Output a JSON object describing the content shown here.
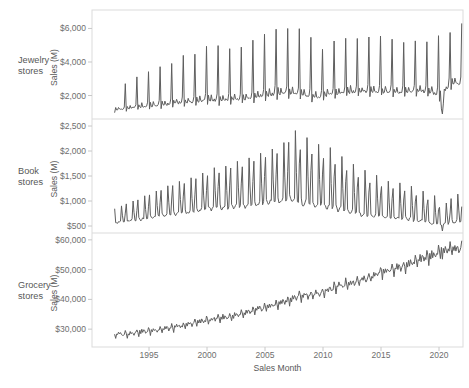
{
  "figure": {
    "background": "#ffffff"
  },
  "chart_data": {
    "type": "line",
    "title": "",
    "xlabel": "Sales Month",
    "legend": "none",
    "grid": "off",
    "line_color": "#5e5e5e",
    "border_color": "#dbdbdb",
    "tick_color": "#c8c8c8",
    "text_color": "#6e6e6e",
    "x_range": [
      1992,
      2022
    ],
    "x_ticks": {
      "values": [
        1995,
        2000,
        2005,
        2010,
        2015,
        2020
      ],
      "labels": [
        "1995",
        "2000",
        "2005",
        "2010",
        "2015",
        "2020"
      ]
    },
    "start_year": 1992,
    "end_year": 2021,
    "panels": [
      {
        "label": "Jewelry stores",
        "label_lines": [
          "Jewelry",
          "stores"
        ],
        "ylabel": "Sales (M)",
        "y_ticks": {
          "values": [
            2000,
            4000,
            6000
          ],
          "labels": [
            "$2,000",
            "$4,000",
            "$6,000"
          ]
        },
        "y_range": [
          600,
          7100
        ],
        "model": {
          "kind": "spike",
          "years": [
            1992,
            1993,
            1994,
            1995,
            1996,
            1997,
            1998,
            1999,
            2000,
            2001,
            2002,
            2003,
            2004,
            2005,
            2006,
            2007,
            2008,
            2009,
            2010,
            2011,
            2012,
            2013,
            2014,
            2015,
            2016,
            2017,
            2018,
            2019,
            2020,
            2021
          ],
          "base": [
            1100,
            1150,
            1250,
            1300,
            1350,
            1450,
            1500,
            1550,
            1650,
            1600,
            1650,
            1700,
            1800,
            1900,
            2000,
            2050,
            1950,
            1800,
            1900,
            2000,
            2100,
            2150,
            2150,
            2150,
            2100,
            2100,
            2150,
            2150,
            1900,
            2600
          ],
          "peak": [
            2700,
            3100,
            3450,
            3750,
            3900,
            4400,
            4450,
            4900,
            4950,
            4750,
            4900,
            5250,
            5600,
            5900,
            6000,
            5950,
            5450,
            4750,
            5250,
            5400,
            5450,
            5500,
            5550,
            5350,
            5200,
            5300,
            5250,
            5550,
            5800,
            6300
          ],
          "seasonal_shape": [
            -0.05,
            0.1,
            0.02,
            0.02,
            0.12,
            0.04,
            0.02,
            0.04,
            0.02,
            0.04,
            0.14,
            1.0
          ],
          "jitter": 0.035,
          "overrides": {
            "2020-3": 1200,
            "2020-4": 900,
            "2020-5": 1500
          }
        }
      },
      {
        "label": "Book stores",
        "label_lines": [
          "Book",
          "stores"
        ],
        "ylabel": "Sales (M)",
        "y_ticks": {
          "values": [
            500,
            1000,
            1500,
            2000,
            2500
          ],
          "labels": [
            "$500",
            "$1,000",
            "$1,500",
            "$2,000",
            "$2,500"
          ]
        },
        "y_range": [
          360,
          2640
        ],
        "model": {
          "kind": "spike",
          "years": [
            1992,
            1993,
            1994,
            1995,
            1996,
            1997,
            1998,
            1999,
            2000,
            2001,
            2002,
            2003,
            2004,
            2005,
            2006,
            2007,
            2008,
            2009,
            2010,
            2011,
            2012,
            2013,
            2014,
            2015,
            2016,
            2017,
            2018,
            2019,
            2020,
            2021
          ],
          "base": [
            550,
            570,
            600,
            640,
            680,
            700,
            720,
            750,
            800,
            820,
            830,
            850,
            870,
            900,
            920,
            950,
            900,
            850,
            820,
            780,
            740,
            700,
            660,
            640,
            620,
            600,
            570,
            550,
            480,
            550
          ],
          "peak": [
            900,
            1000,
            1100,
            1200,
            1300,
            1400,
            1450,
            1550,
            1650,
            1700,
            1800,
            1850,
            1950,
            2050,
            2150,
            2400,
            2250,
            2150,
            2050,
            1900,
            1750,
            1600,
            1500,
            1400,
            1350,
            1300,
            1200,
            1100,
            950,
            1150
          ],
          "seasonal_shape": [
            0.85,
            0.1,
            0.05,
            0.02,
            0.03,
            0.07,
            0.1,
            1.0,
            0.45,
            0.04,
            0.07,
            0.55
          ],
          "jitter": 0.04,
          "overrides": {
            "2020-3": 520,
            "2020-4": 400,
            "2020-5": 520
          }
        }
      },
      {
        "label": "Grocery stores",
        "label_lines": [
          "Grocery",
          "stores"
        ],
        "ylabel": "Sales (M)",
        "y_ticks": {
          "values": [
            30000,
            40000,
            50000,
            60000
          ],
          "labels": [
            "$30,000",
            "$40,000",
            "$50,000",
            "$60,000"
          ]
        },
        "y_range": [
          24000,
          62300
        ],
        "model": {
          "kind": "trend",
          "years": [
            1992,
            1993,
            1994,
            1995,
            1996,
            1997,
            1998,
            1999,
            2000,
            2001,
            2002,
            2003,
            2004,
            2005,
            2006,
            2007,
            2008,
            2009,
            2010,
            2011,
            2012,
            2013,
            2014,
            2015,
            2016,
            2017,
            2018,
            2019,
            2020,
            2021
          ],
          "avg": [
            28200,
            28400,
            29000,
            29400,
            30000,
            30500,
            31200,
            32300,
            33000,
            33800,
            34200,
            35000,
            36200,
            37400,
            38400,
            39800,
            41200,
            41500,
            42500,
            44000,
            45300,
            46200,
            47600,
            49300,
            50200,
            51300,
            52800,
            54300,
            55800,
            57000
          ],
          "seasonal_shape": [
            0.004,
            -0.045,
            0.008,
            -0.012,
            0.022,
            -0.006,
            0.014,
            0.004,
            -0.022,
            -0.004,
            -0.002,
            0.035
          ],
          "jitter": 0.012,
          "overrides": {
            "2020-3": 57500,
            "2020-4": 53500
          }
        }
      }
    ]
  }
}
